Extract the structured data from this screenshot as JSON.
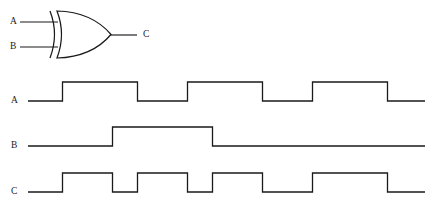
{
  "figure": {
    "kind": "logic-gate-timing-diagram",
    "background_color": "#ffffff",
    "line_color": "#1a1a1a"
  },
  "gate": {
    "type": "XOR",
    "symbol_style": "distinctive-shape-ieee-ansi",
    "inputs": [
      {
        "name": "input-a",
        "label": "A",
        "label_x": 10,
        "label_y": 22,
        "wire_x1": 20,
        "wire_x2": 58,
        "wire_y": 22
      },
      {
        "name": "input-b",
        "label": "B",
        "label_x": 10,
        "label_y": 47,
        "wire_x1": 20,
        "wire_x2": 58,
        "wire_y": 47
      }
    ],
    "output": {
      "name": "output-c",
      "label": "C",
      "label_x": 143,
      "label_y": 35,
      "wire_x1": 111,
      "wire_x2": 137,
      "wire_y": 35
    },
    "body": {
      "x_left": 56,
      "x_right": 112,
      "y_top": 11,
      "y_bottom": 58,
      "back_arc_x": 50,
      "arc_bulge": 9
    }
  },
  "timing": {
    "x_start": 28,
    "x_end": 425,
    "unit": 24.8,
    "high_offset": -19,
    "channels": [
      {
        "name": "waveform-a",
        "label": "A",
        "label_x": 11,
        "baseline_y": 101,
        "start_level": 0,
        "edges": [
          62.5,
          137.5,
          187.5,
          262.5,
          312.5,
          387.5
        ],
        "description": "A: square wave, period 100px, 50% duty, first rise at 62"
      },
      {
        "name": "waveform-b",
        "label": "B",
        "label_x": 11,
        "baseline_y": 146,
        "start_level": 0,
        "edges": [
          112.5,
          212.5
        ],
        "description": "B: single pulse high from 112 to 212"
      },
      {
        "name": "waveform-c",
        "label": "C",
        "label_x": 11,
        "baseline_y": 192,
        "start_level": 0,
        "edges": [
          62.5,
          112.5,
          137.5,
          187.5,
          212.5,
          262.5,
          312.5,
          387.5
        ],
        "description": "C = A XOR B"
      }
    ]
  },
  "truth_table": {
    "headers": [
      "A",
      "B",
      "C"
    ],
    "rows": [
      [
        "0",
        "0",
        "0"
      ],
      [
        "0",
        "1",
        "1"
      ],
      [
        "1",
        "0",
        "1"
      ],
      [
        "1",
        "1",
        "0"
      ]
    ]
  },
  "chart_data": {
    "type": "line",
    "xlabel": "",
    "ylabel": "",
    "x": [
      28,
      62.5,
      112.5,
      137.5,
      187.5,
      212.5,
      262.5,
      312.5,
      387.5,
      425
    ],
    "series": [
      {
        "name": "A",
        "values": [
          0,
          1,
          1,
          0,
          1,
          1,
          0,
          1,
          0,
          0
        ]
      },
      {
        "name": "B",
        "values": [
          0,
          0,
          1,
          1,
          1,
          0,
          0,
          0,
          0,
          0
        ]
      },
      {
        "name": "C",
        "values": [
          0,
          1,
          0,
          1,
          0,
          1,
          0,
          1,
          0,
          0
        ]
      }
    ],
    "ylim": [
      0,
      1
    ],
    "grid": false,
    "legend": "none"
  }
}
